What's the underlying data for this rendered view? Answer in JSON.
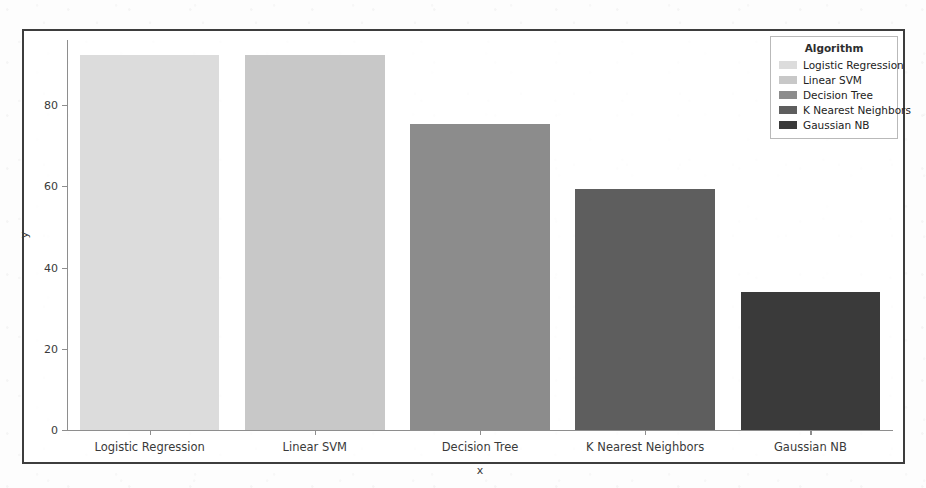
{
  "chart_data": {
    "type": "bar",
    "title": "",
    "xlabel": "x",
    "ylabel": "y",
    "categories": [
      "Logistic Regression",
      "Linear SVM",
      "Decision Tree",
      "K Nearest Neighbors",
      "Gaussian NB"
    ],
    "values": [
      92.4,
      92.4,
      75.4,
      59.3,
      34.0
    ],
    "series": [
      {
        "name": "Algorithm",
        "values": [
          92.4,
          92.4,
          75.4,
          59.3,
          34.0
        ]
      }
    ],
    "bar_colors": [
      "#dcdcdc",
      "#c8c8c8",
      "#8c8c8c",
      "#5e5e5e",
      "#3a3a3a"
    ],
    "ylim": [
      0,
      96
    ],
    "yticks": [
      0,
      20,
      40,
      60,
      80
    ],
    "ytick_labels": [
      "0",
      "20",
      "40",
      "60",
      "80"
    ],
    "grid": false,
    "legend_position": "upper right",
    "legend": {
      "title": "Algorithm",
      "entries": [
        {
          "label": "Logistic Regression",
          "color": "#dcdcdc"
        },
        {
          "label": "Linear SVM",
          "color": "#c8c8c8"
        },
        {
          "label": "Decision Tree",
          "color": "#8c8c8c"
        },
        {
          "label": "K Nearest Neighbors",
          "color": "#5e5e5e"
        },
        {
          "label": "Gaussian NB",
          "color": "#3a3a3a"
        }
      ]
    }
  },
  "figure": {
    "frame_color": "#3d3d3d",
    "background_color": "#fdfdfd",
    "axis_color": "#8e8e8e"
  }
}
